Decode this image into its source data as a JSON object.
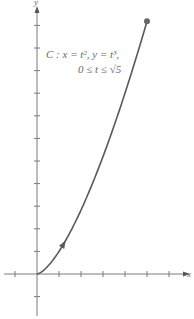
{
  "chart_data": {
    "type": "line",
    "title": "",
    "xlabel": "x",
    "ylabel": "y",
    "xlim": [
      -1,
      6.3
    ],
    "ylim": [
      -1.8,
      11.8
    ],
    "x_ticks": [
      -1,
      1,
      2,
      3,
      4,
      5,
      6
    ],
    "y_ticks": [
      -1,
      1,
      2,
      3,
      4,
      5,
      6,
      7,
      8,
      9,
      10,
      11
    ],
    "grid": false,
    "series": [
      {
        "name": "C",
        "parametric": {
          "x": "t^2",
          "y": "t^3",
          "t_range": [
            0,
            2.2360679775
          ]
        },
        "x": [
          0,
          0.25,
          0.5,
          1,
          1.5,
          2,
          2.5,
          3,
          3.5,
          4,
          4.5,
          5
        ],
        "y": [
          0,
          0.125,
          0.354,
          1,
          1.837,
          2.828,
          3.953,
          5.196,
          6.548,
          8,
          9.546,
          11.18
        ],
        "direction_arrow_at_t": 1.1,
        "endpoint_marker": {
          "x": 5,
          "y": 11.18
        }
      }
    ],
    "annotations": [
      {
        "text_line1": "C : x = t², y = t³,",
        "text_line2": "0 ≤ t ≤ √5"
      }
    ]
  },
  "labels": {
    "x_axis": "x",
    "y_axis": "y",
    "curve_line1": "C : x = t², y = t³,",
    "curve_line2": "0 ≤ t ≤ √5"
  },
  "colors": {
    "axis": "#7a7a7a",
    "curve": "#5a5a5a"
  }
}
